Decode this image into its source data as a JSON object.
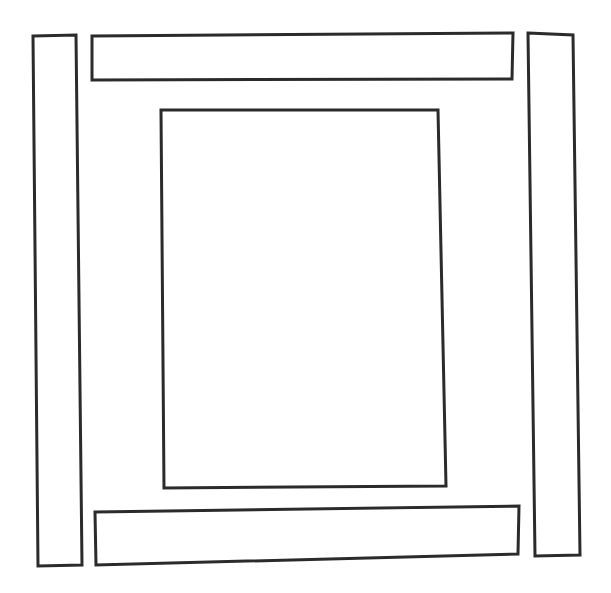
{
  "figure": {
    "style": {
      "background_color": "#ffffff",
      "stroke_color": "#2b2b2b",
      "fill_color": "#ffffff",
      "stroke_width": 3,
      "rendering": "hand-drawn ink outline, no text labels"
    },
    "canvas": {
      "width": 611,
      "height": 593
    },
    "shapes": [
      {
        "id": "left-bar",
        "label": "left vertical bar",
        "orientation": "vertical",
        "points": "33,36 76,35 82,565 38,566"
      },
      {
        "id": "top-bar",
        "label": "top horizontal bar",
        "orientation": "horizontal",
        "points": "92,36 513,33 512,79 92,80"
      },
      {
        "id": "right-bar",
        "label": "right vertical bar",
        "orientation": "vertical",
        "points": "528,33 573,35 580,555 535,556"
      },
      {
        "id": "bottom-bar",
        "label": "bottom horizontal bar",
        "orientation": "horizontal",
        "points": "95,512 519,506 518,554 96,565"
      },
      {
        "id": "center-rect",
        "label": "central rectangle",
        "orientation": "portrait",
        "points": "161,110 438,110 446,486 164,488"
      }
    ]
  }
}
